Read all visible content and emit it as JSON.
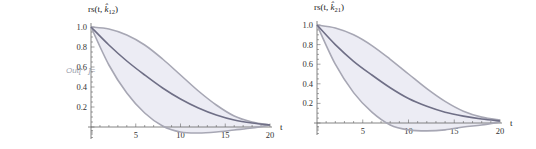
{
  "output_label": "Out[ · ]=",
  "colors": {
    "band_fill": "#ececf4",
    "band_edge": "#a7a7b4",
    "center_line": "#6f6f86",
    "axis": "#666666"
  },
  "chart_data": [
    {
      "type": "area",
      "title": "",
      "ylabel": "rs(t, k̂₁₂)",
      "ylabel_base": "rs(t, k",
      "ylabel_sub": "12",
      "xlabel": "t",
      "xlim": [
        0,
        20
      ],
      "ylim": [
        -0.06,
        1.0
      ],
      "x_ticks": [
        5,
        10,
        15,
        20
      ],
      "y_ticks": [
        0.2,
        0.4,
        0.6,
        0.8,
        1.0
      ],
      "x_tick_labels": [
        "5",
        "10",
        "15",
        "20"
      ],
      "y_tick_labels": [
        "0.2",
        "0.4",
        "0.6",
        "0.8",
        "1.0"
      ],
      "grid": false,
      "legend": null,
      "x": [
        0,
        2,
        4,
        6,
        8,
        10,
        12,
        14,
        16,
        18,
        20
      ],
      "series": [
        {
          "name": "upper",
          "values": [
            1.0,
            0.98,
            0.92,
            0.82,
            0.68,
            0.52,
            0.36,
            0.22,
            0.11,
            0.05,
            0.02
          ]
        },
        {
          "name": "center",
          "values": [
            1.0,
            0.82,
            0.66,
            0.52,
            0.39,
            0.28,
            0.19,
            0.12,
            0.07,
            0.04,
            0.02
          ]
        },
        {
          "name": "lower",
          "values": [
            1.0,
            0.62,
            0.34,
            0.14,
            0.01,
            -0.05,
            -0.06,
            -0.05,
            -0.03,
            -0.01,
            0.02
          ]
        }
      ]
    },
    {
      "type": "area",
      "title": "",
      "ylabel": "rs(t, k̂₂₁)",
      "ylabel_base": "rs(t, k",
      "ylabel_sub": "21",
      "xlabel": "t",
      "xlim": [
        0,
        20
      ],
      "ylim": [
        -0.06,
        1.0
      ],
      "x_ticks": [
        5,
        10,
        15,
        20
      ],
      "y_ticks": [
        0.2,
        0.4,
        0.6,
        0.8,
        1.0
      ],
      "x_tick_labels": [
        "5",
        "10",
        "15",
        "20"
      ],
      "y_tick_labels": [
        "0.2",
        "0.4",
        "0.6",
        "0.8",
        "1.0"
      ],
      "grid": false,
      "legend": null,
      "x": [
        0,
        2,
        4,
        6,
        8,
        10,
        12,
        14,
        16,
        18,
        20
      ],
      "series": [
        {
          "name": "upper",
          "values": [
            1.0,
            0.97,
            0.9,
            0.79,
            0.65,
            0.5,
            0.35,
            0.22,
            0.12,
            0.06,
            0.03
          ]
        },
        {
          "name": "center",
          "values": [
            1.0,
            0.8,
            0.63,
            0.49,
            0.36,
            0.25,
            0.17,
            0.11,
            0.07,
            0.04,
            0.02
          ]
        },
        {
          "name": "lower",
          "values": [
            1.0,
            0.6,
            0.31,
            0.11,
            -0.02,
            -0.07,
            -0.08,
            -0.07,
            -0.04,
            -0.02,
            0.01
          ]
        }
      ]
    }
  ]
}
